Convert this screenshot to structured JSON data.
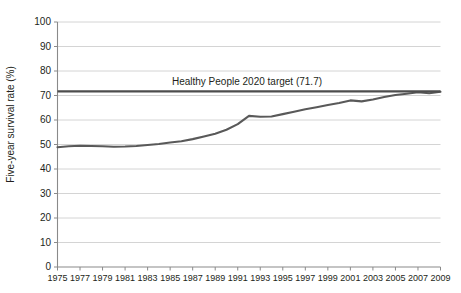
{
  "chart_data": {
    "type": "line",
    "title": "",
    "subtitle": "",
    "xlabel": "",
    "ylabel": "Five-year survival rate (%)",
    "xlim": [
      1975,
      2009
    ],
    "ylim": [
      0,
      100
    ],
    "ytick_step": 10,
    "xtick_step": 2,
    "grid": "horizontal",
    "legend": "none",
    "line_color": "#595959",
    "target_color": "#4d4d4d",
    "grid_color": "#c9c9c9",
    "axis_color": "#8a8a8a",
    "text_color": "#231f20",
    "ytick_labels": [
      "0",
      "10",
      "20",
      "30",
      "40",
      "50",
      "60",
      "70",
      "80",
      "90",
      "100"
    ],
    "ytick_values": [
      0,
      10,
      20,
      30,
      40,
      50,
      60,
      70,
      80,
      90,
      100
    ],
    "xtick_labels": [
      "1975",
      "1977",
      "1979",
      "1981",
      "1983",
      "1985",
      "1987",
      "1989",
      "1991",
      "1993",
      "1995",
      "1997",
      "1999",
      "2001",
      "2003",
      "2005",
      "2007",
      "2009"
    ],
    "xtick_values": [
      1975,
      1977,
      1979,
      1981,
      1983,
      1985,
      1987,
      1989,
      1991,
      1993,
      1995,
      1997,
      1999,
      2001,
      2003,
      2005,
      2007,
      2009
    ],
    "series": [
      {
        "name": "Five-year survival rate",
        "x": [
          1975,
          1976,
          1977,
          1978,
          1979,
          1980,
          1981,
          1982,
          1983,
          1984,
          1985,
          1986,
          1987,
          1988,
          1989,
          1990,
          1991,
          1992,
          1993,
          1994,
          1995,
          1996,
          1997,
          1998,
          1999,
          2000,
          2001,
          2002,
          2003,
          2004,
          2005,
          2006,
          2007,
          2008,
          2009
        ],
        "values": [
          48.9,
          49.3,
          49.5,
          49.4,
          49.3,
          49.1,
          49.2,
          49.4,
          49.8,
          50.2,
          50.8,
          51.3,
          52.2,
          53.3,
          54.4,
          56.0,
          58.3,
          61.7,
          61.3,
          61.4,
          62.4,
          63.4,
          64.4,
          65.2,
          66.1,
          66.9,
          68.0,
          67.6,
          68.4,
          69.4,
          70.2,
          70.7,
          71.3,
          70.9,
          71.5
        ]
      }
    ],
    "reference_lines": [
      {
        "name": "Healthy People 2020 target",
        "label": "Healthy People 2020 target (71.7)",
        "value": 71.7
      }
    ]
  },
  "annotation": {
    "target_label": "Healthy People 2020 target (71.7)"
  }
}
